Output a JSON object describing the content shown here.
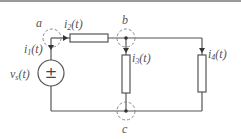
{
  "diagram": {
    "type": "circuit",
    "colors": {
      "wire": "#555555",
      "node_circle": "#888888",
      "label": "#555555"
    },
    "nodes": [
      {
        "id": "a",
        "label": "a"
      },
      {
        "id": "b",
        "label": "b"
      },
      {
        "id": "c",
        "label": "c"
      }
    ],
    "currents": [
      {
        "id": "i1",
        "base": "i",
        "sub": "1",
        "suffix": "(t)"
      },
      {
        "id": "i2",
        "base": "i",
        "sub": "2",
        "suffix": "(t)"
      },
      {
        "id": "i3",
        "base": "i",
        "sub": "3",
        "suffix": "(t)"
      },
      {
        "id": "i4",
        "base": "i",
        "sub": "4",
        "suffix": "(t)"
      }
    ],
    "source": {
      "base": "v",
      "sub": "s",
      "suffix": "(t)",
      "symbol": "±"
    }
  }
}
